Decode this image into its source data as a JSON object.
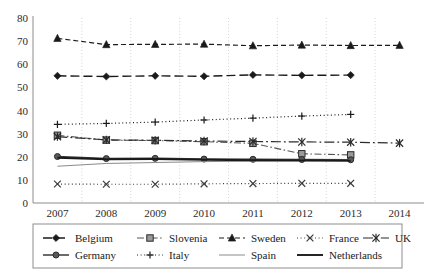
{
  "chart_data": {
    "type": "line",
    "title": "",
    "subtitle": "",
    "xlabel": "",
    "ylabel": "",
    "x": [
      2007,
      2008,
      2009,
      2010,
      2011,
      2012,
      2013,
      2014
    ],
    "categories": [
      "2007",
      "2008",
      "2009",
      "2010",
      "2011",
      "2012",
      "2013",
      "2014"
    ],
    "ylim": [
      0,
      80
    ],
    "yticks": [
      0,
      10,
      20,
      30,
      40,
      50,
      60,
      70,
      80
    ],
    "ytick_labels": [
      "0",
      "10",
      "20",
      "30",
      "40",
      "50",
      "60",
      "70",
      "80"
    ],
    "grid": "vertical-dotted",
    "legend_position": "bottom",
    "series": [
      {
        "name": "Belgium",
        "marker": "diamond",
        "dash": "long-dash",
        "color": "#1a1a1a",
        "values": [
          55.0,
          54.7,
          55.0,
          54.8,
          55.4,
          55.2,
          55.3,
          null
        ]
      },
      {
        "name": "Slovenia",
        "marker": "square",
        "dash": "dash-dot",
        "color": "#555555",
        "values": [
          29.3,
          27.2,
          27.0,
          26.5,
          25.8,
          21.3,
          20.8,
          null
        ]
      },
      {
        "name": "Sweden",
        "marker": "triangle",
        "dash": "dash",
        "color": "#1a1a1a",
        "values": [
          71.2,
          68.5,
          68.6,
          68.7,
          68.0,
          68.3,
          68.1,
          68.2
        ]
      },
      {
        "name": "France",
        "marker": "x-cross",
        "dash": "dot",
        "color": "#3a3a3a",
        "values": [
          8.2,
          8.1,
          8.1,
          8.3,
          8.4,
          8.5,
          8.5,
          null
        ]
      },
      {
        "name": "UK",
        "marker": "star-cross",
        "dash": "long-dash-dot",
        "color": "#2b2b2b",
        "values": [
          28.7,
          27.3,
          27.1,
          26.8,
          26.6,
          26.4,
          26.3,
          25.9
        ]
      },
      {
        "name": "Germany",
        "marker": "circle",
        "dash": "solid",
        "color": "#3a3a3a",
        "values": [
          20.1,
          19.2,
          19.3,
          19.0,
          18.9,
          18.8,
          18.7,
          null
        ]
      },
      {
        "name": "Italy",
        "marker": "plus",
        "dash": "dot",
        "color": "#1a1a1a",
        "values": [
          34.0,
          34.4,
          35.0,
          35.9,
          36.7,
          37.6,
          38.3,
          null
        ]
      },
      {
        "name": "Spain",
        "marker": "none",
        "dash": "solid-thin",
        "color": "#8a8a8a",
        "values": [
          15.9,
          17.1,
          17.5,
          17.9,
          18.1,
          18.3,
          18.5,
          null
        ]
      },
      {
        "name": "Netherlands",
        "marker": "none",
        "dash": "solid-thick",
        "color": "#1a1a1a",
        "values": [
          19.6,
          18.9,
          19.0,
          18.7,
          18.5,
          18.4,
          18.3,
          null
        ]
      }
    ]
  },
  "legend": {
    "row1": [
      "Belgium",
      "Slovenia",
      "Sweden",
      "France",
      "UK"
    ],
    "row2": [
      "Germany",
      "Italy",
      "Spain",
      "Netherlands"
    ]
  }
}
